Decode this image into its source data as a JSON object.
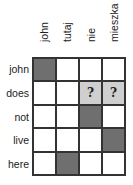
{
  "columns": [
    "john",
    "tutaj",
    "nie",
    "mieszka"
  ],
  "rows": [
    {
      "label": "john",
      "cells": [
        "full",
        "",
        "",
        ""
      ]
    },
    {
      "label": "does",
      "cells": [
        "",
        "",
        "maybe",
        "maybe"
      ]
    },
    {
      "label": "not",
      "cells": [
        "",
        "",
        "full",
        ""
      ]
    },
    {
      "label": "live",
      "cells": [
        "",
        "",
        "",
        "full"
      ]
    },
    {
      "label": "here",
      "cells": [
        "",
        "full",
        "",
        ""
      ]
    }
  ],
  "maybe_mark": "?",
  "colors": {
    "full": "#6f6f6f",
    "maybe": "#cfcfcf",
    "grid": "#333333"
  }
}
